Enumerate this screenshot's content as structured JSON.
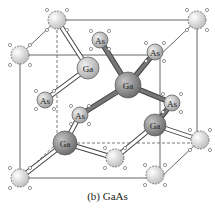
{
  "caption": "(b) GaAs",
  "colors": {
    "ga_fill": "#8e8e8e",
    "ga_light_fill": "#bdbdbd",
    "as_fill": "#c8c8c8",
    "corner_fill": "#e2e2e2",
    "line": "#555555",
    "bond_outline": "#444444",
    "bond_fill": "#ffffff",
    "bond_dark": "#777777"
  },
  "atoms": [
    {
      "id": "c1",
      "type": "corner",
      "x": 57,
      "y": 20,
      "r": 9,
      "label": ""
    },
    {
      "id": "c2",
      "type": "corner",
      "x": 197,
      "y": 20,
      "r": 9,
      "label": ""
    },
    {
      "id": "c3",
      "type": "corner",
      "x": 20,
      "y": 55,
      "r": 9,
      "label": ""
    },
    {
      "id": "c4",
      "type": "corner",
      "x": 20,
      "y": 178,
      "r": 9,
      "label": ""
    },
    {
      "id": "c5",
      "type": "corner",
      "x": 115,
      "y": 158,
      "r": 9,
      "label": ""
    },
    {
      "id": "c6",
      "type": "corner",
      "x": 200,
      "y": 140,
      "r": 9,
      "label": ""
    },
    {
      "id": "c7",
      "type": "corner",
      "x": 155,
      "y": 175,
      "r": 9,
      "label": ""
    },
    {
      "id": "as1",
      "type": "as",
      "x": 100,
      "y": 40,
      "r": 8,
      "label": "As"
    },
    {
      "id": "as2",
      "type": "as",
      "x": 155,
      "y": 52,
      "r": 8,
      "label": "As"
    },
    {
      "id": "as3",
      "type": "as",
      "x": 45,
      "y": 100,
      "r": 8,
      "label": "As"
    },
    {
      "id": "as4",
      "type": "as",
      "x": 80,
      "y": 115,
      "r": 8,
      "label": "As"
    },
    {
      "id": "as5",
      "type": "as",
      "x": 172,
      "y": 103,
      "r": 8,
      "label": "As"
    },
    {
      "id": "ga1",
      "type": "ga_light",
      "x": 88,
      "y": 68,
      "r": 11,
      "label": "Ga"
    },
    {
      "id": "ga2",
      "type": "ga",
      "x": 128,
      "y": 85,
      "r": 13,
      "label": "Ga"
    },
    {
      "id": "ga3",
      "type": "ga",
      "x": 155,
      "y": 125,
      "r": 11,
      "label": "Ga"
    },
    {
      "id": "ga4",
      "type": "ga",
      "x": 65,
      "y": 143,
      "r": 12,
      "label": "Ga"
    }
  ],
  "cube_edges": [
    [
      57,
      20,
      197,
      20
    ],
    [
      20,
      55,
      160,
      55
    ],
    [
      57,
      20,
      20,
      55
    ],
    [
      197,
      20,
      160,
      55
    ],
    [
      20,
      55,
      20,
      178
    ],
    [
      160,
      55,
      160,
      178
    ],
    [
      197,
      20,
      197,
      143
    ],
    [
      20,
      178,
      160,
      178
    ],
    [
      160,
      178,
      197,
      143
    ]
  ],
  "hidden_edges": [
    [
      57,
      20,
      57,
      143
    ],
    [
      57,
      143,
      197,
      143
    ],
    [
      57,
      143,
      20,
      178
    ]
  ],
  "bonds_light": [
    [
      57,
      20,
      88,
      68
    ],
    [
      88,
      68,
      45,
      100
    ],
    [
      65,
      143,
      20,
      178
    ],
    [
      65,
      143,
      115,
      158
    ],
    [
      115,
      158,
      155,
      125
    ],
    [
      155,
      125,
      200,
      140
    ],
    [
      80,
      115,
      65,
      143
    ]
  ],
  "bonds_dark": [
    [
      128,
      85,
      100,
      40
    ],
    [
      128,
      85,
      155,
      52
    ],
    [
      128,
      85,
      172,
      103
    ],
    [
      128,
      85,
      80,
      115
    ],
    [
      155,
      125,
      172,
      103
    ]
  ]
}
